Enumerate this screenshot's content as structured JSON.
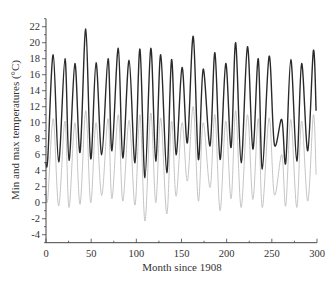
{
  "chart_data": {
    "type": "line",
    "title": "",
    "xlabel": "Month since 1908",
    "ylabel": "Min and max temperatures (°C)",
    "xlim": [
      0,
      300
    ],
    "ylim": [
      -5,
      23
    ],
    "xticks": [
      0,
      50,
      100,
      150,
      200,
      250,
      300
    ],
    "yticks": [
      -4,
      -2,
      0,
      2,
      4,
      6,
      8,
      10,
      12,
      14,
      16,
      18,
      20,
      22
    ],
    "grid": false,
    "legend": null,
    "series": [
      {
        "name": "Max temperature",
        "color": "#2a2a2a",
        "points": [
          [
            0,
            5.0
          ],
          [
            2,
            5.6
          ],
          [
            8,
            18.5
          ],
          [
            14,
            5.1
          ],
          [
            21,
            18.0
          ],
          [
            25.5,
            5.3
          ],
          [
            32,
            17.4
          ],
          [
            37.7,
            6.3
          ],
          [
            44,
            21.7
          ],
          [
            49.5,
            5.5
          ],
          [
            55.4,
            17.5
          ],
          [
            61.7,
            6.0
          ],
          [
            68.7,
            18.0
          ],
          [
            73,
            6.5
          ],
          [
            80,
            19.3
          ],
          [
            85,
            5.6
          ],
          [
            92,
            17.8
          ],
          [
            98.5,
            5.0
          ],
          [
            104,
            19.2
          ],
          [
            109.6,
            3.1
          ],
          [
            116,
            19.3
          ],
          [
            121.5,
            5.2
          ],
          [
            127,
            18.5
          ],
          [
            133.7,
            3.75
          ],
          [
            139,
            17.9
          ],
          [
            144,
            6.0
          ],
          [
            150.6,
            16.9
          ],
          [
            156.5,
            7.5
          ],
          [
            163,
            20.8
          ],
          [
            168.7,
            5.4
          ],
          [
            174,
            16.7
          ],
          [
            181.6,
            7.1
          ],
          [
            187,
            18.75
          ],
          [
            192.7,
            5.4
          ],
          [
            199,
            17.4
          ],
          [
            204.9,
            6.9
          ],
          [
            210,
            20.0
          ],
          [
            216,
            5.0
          ],
          [
            223,
            19.5
          ],
          [
            229,
            6.7
          ],
          [
            235,
            18.0
          ],
          [
            239.5,
            4.2
          ],
          [
            247,
            18.3
          ],
          [
            252.8,
            7.3
          ],
          [
            261,
            10.4
          ],
          [
            265.4,
            5.0
          ],
          [
            271,
            17.9
          ],
          [
            277.6,
            5.2
          ],
          [
            283,
            17.4
          ],
          [
            289.8,
            6.5
          ],
          [
            296,
            19.0
          ],
          [
            299,
            11.5
          ]
        ]
      },
      {
        "name": "Min temperature",
        "color": "#bdbdbd",
        "points": [
          [
            0,
            1.5
          ],
          [
            2,
            0.5
          ],
          [
            8,
            10.5
          ],
          [
            14,
            -0.4
          ],
          [
            21,
            10.2
          ],
          [
            25.5,
            -0.6
          ],
          [
            32,
            10.0
          ],
          [
            37.7,
            -0.2
          ],
          [
            44,
            11.5
          ],
          [
            49.5,
            0.0
          ],
          [
            55.4,
            10.0
          ],
          [
            61.7,
            0.9
          ],
          [
            68.7,
            10.5
          ],
          [
            73,
            0.5
          ],
          [
            80,
            11.0
          ],
          [
            85,
            0.2
          ],
          [
            92,
            10.3
          ],
          [
            98.5,
            -0.3
          ],
          [
            104,
            11.0
          ],
          [
            109.6,
            -2.3
          ],
          [
            116,
            11.2
          ],
          [
            121.5,
            0.0
          ],
          [
            127,
            10.6
          ],
          [
            133.7,
            -1.4
          ],
          [
            139,
            10.2
          ],
          [
            144,
            0.8
          ],
          [
            150.6,
            10.0
          ],
          [
            156.5,
            2.7
          ],
          [
            163,
            12.0
          ],
          [
            168.7,
            0.2
          ],
          [
            174,
            10.0
          ],
          [
            181.6,
            1.9
          ],
          [
            187,
            11.0
          ],
          [
            192.7,
            -1.0
          ],
          [
            199,
            10.2
          ],
          [
            204.9,
            0.5
          ],
          [
            210,
            11.5
          ],
          [
            216,
            -0.6
          ],
          [
            223,
            11.0
          ],
          [
            229,
            0.4
          ],
          [
            235,
            10.5
          ],
          [
            239.5,
            -0.6
          ],
          [
            247,
            10.6
          ],
          [
            252.8,
            1.0
          ],
          [
            261,
            6.0
          ],
          [
            265.4,
            -0.4
          ],
          [
            271,
            10.4
          ],
          [
            277.6,
            -0.6
          ],
          [
            283,
            10.2
          ],
          [
            289.8,
            0.2
          ],
          [
            296,
            11.0
          ],
          [
            299,
            3.5
          ]
        ]
      }
    ]
  }
}
